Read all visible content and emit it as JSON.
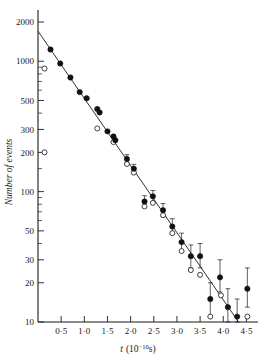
{
  "figure": {
    "background": "#ffffff",
    "ink_color": "#1a1a1a",
    "marker_filled_color": "#111111",
    "marker_open_color": "#ffffff"
  },
  "chart_data": {
    "type": "scatter",
    "title": "",
    "subtitle": "",
    "xlabel_main": "t",
    "xlabel_unit": "(10−10s)",
    "xlabel_unit_base": "(10",
    "xlabel_unit_exp": "−10",
    "xlabel_unit_tail": "s)",
    "ylabel": "Number of events",
    "yscale": "log",
    "xscale": "linear",
    "grid": false,
    "legend": "none",
    "xlim": [
      0.0,
      4.75
    ],
    "ylim": [
      10,
      2000
    ],
    "xticks": [
      0.5,
      1.0,
      1.5,
      2.0,
      2.5,
      3.0,
      3.5,
      4.0,
      4.5
    ],
    "xtick_labels": [
      "0·5",
      "1·0",
      "1·5",
      "2·0",
      "2·5",
      "3·0",
      "3·5",
      "4·0",
      "4·5"
    ],
    "yticks": [
      10,
      20,
      30,
      50,
      100,
      200,
      300,
      500,
      1000,
      2000
    ],
    "ytick_labels": [
      "10",
      "20",
      "30",
      "50",
      "100",
      "200",
      "300",
      "500",
      "1000",
      "2000"
    ],
    "yticks_minor": [
      40,
      60,
      70,
      80,
      90,
      150,
      400,
      600,
      700,
      800,
      900
    ],
    "fit_line": {
      "label": "exponential fit",
      "x_start": 0.0,
      "y_start": 1700,
      "x_end": 4.33,
      "y_end": 10.0
    },
    "series": [
      {
        "name": "filled circles",
        "marker": "filled-circle",
        "points": [
          {
            "x": 0.27,
            "y": 1230,
            "err_lo": 0,
            "err_hi": 0
          },
          {
            "x": 0.48,
            "y": 960,
            "err_lo": 0,
            "err_hi": 0
          },
          {
            "x": 0.7,
            "y": 750,
            "err_lo": 0,
            "err_hi": 0
          },
          {
            "x": 0.9,
            "y": 580,
            "err_lo": 0,
            "err_hi": 0
          },
          {
            "x": 1.05,
            "y": 520,
            "err_lo": 0,
            "err_hi": 0
          },
          {
            "x": 1.28,
            "y": 430,
            "err_lo": 0,
            "err_hi": 0
          },
          {
            "x": 1.33,
            "y": 405,
            "err_lo": 0,
            "err_hi": 0
          },
          {
            "x": 1.5,
            "y": 290,
            "err_lo": 0,
            "err_hi": 0
          },
          {
            "x": 1.63,
            "y": 265,
            "err_lo": 0,
            "err_hi": 0
          },
          {
            "x": 1.67,
            "y": 248,
            "err_lo": 0,
            "err_hi": 0
          },
          {
            "x": 1.92,
            "y": 178,
            "err_lo": 12,
            "err_hi": 14
          },
          {
            "x": 2.07,
            "y": 150,
            "err_lo": 11,
            "err_hi": 12
          },
          {
            "x": 2.3,
            "y": 84,
            "err_lo": 8,
            "err_hi": 9
          },
          {
            "x": 2.48,
            "y": 92,
            "err_lo": 9,
            "err_hi": 10
          },
          {
            "x": 2.7,
            "y": 72,
            "err_lo": 8,
            "err_hi": 9
          },
          {
            "x": 2.9,
            "y": 54,
            "err_lo": 7,
            "err_hi": 8
          },
          {
            "x": 3.1,
            "y": 41,
            "err_lo": 6,
            "err_hi": 7
          },
          {
            "x": 3.3,
            "y": 32,
            "err_lo": 6,
            "err_hi": 7
          },
          {
            "x": 3.5,
            "y": 32,
            "err_lo": 6,
            "err_hi": 8
          },
          {
            "x": 3.72,
            "y": 15,
            "err_lo": 4,
            "err_hi": 5
          },
          {
            "x": 3.93,
            "y": 22,
            "err_lo": 5,
            "err_hi": 8
          },
          {
            "x": 4.1,
            "y": 13,
            "err_lo": 3,
            "err_hi": 5
          },
          {
            "x": 4.3,
            "y": 11,
            "err_lo": 2,
            "err_hi": 4
          },
          {
            "x": 4.52,
            "y": 18,
            "err_lo": 5,
            "err_hi": 8
          }
        ]
      },
      {
        "name": "open circles",
        "marker": "open-circle",
        "points": [
          {
            "x": 0.14,
            "y": 880,
            "err_lo": 0,
            "err_hi": 0
          },
          {
            "x": 0.14,
            "y": 200,
            "err_lo": 0,
            "err_hi": 0
          },
          {
            "x": 1.28,
            "y": 305,
            "err_lo": 0,
            "err_hi": 0
          },
          {
            "x": 1.63,
            "y": 240,
            "err_lo": 0,
            "err_hi": 0
          },
          {
            "x": 1.92,
            "y": 163,
            "err_lo": 0,
            "err_hi": 0
          },
          {
            "x": 2.07,
            "y": 140,
            "err_lo": 0,
            "err_hi": 0
          },
          {
            "x": 2.3,
            "y": 77,
            "err_lo": 0,
            "err_hi": 0
          },
          {
            "x": 2.48,
            "y": 82,
            "err_lo": 0,
            "err_hi": 0
          },
          {
            "x": 2.7,
            "y": 66,
            "err_lo": 0,
            "err_hi": 0
          },
          {
            "x": 2.9,
            "y": 48,
            "err_lo": 0,
            "err_hi": 0
          },
          {
            "x": 3.1,
            "y": 35,
            "err_lo": 0,
            "err_hi": 0
          },
          {
            "x": 3.3,
            "y": 25,
            "err_lo": 0,
            "err_hi": 0
          },
          {
            "x": 3.5,
            "y": 23,
            "err_lo": 0,
            "err_hi": 0
          },
          {
            "x": 3.72,
            "y": 11,
            "err_lo": 0,
            "err_hi": 0
          },
          {
            "x": 3.95,
            "y": 16,
            "err_lo": 0,
            "err_hi": 0
          },
          {
            "x": 4.52,
            "y": 11,
            "err_lo": 0,
            "err_hi": 0
          }
        ]
      }
    ]
  }
}
